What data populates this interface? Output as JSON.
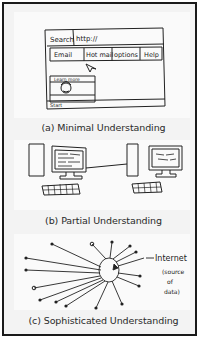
{
  "figure": {
    "panels": [
      {
        "id": "a",
        "caption": "(a) Minimal Understanding",
        "sketch": {
          "type": "browser-window-drawing",
          "address_bar": {
            "label": "Search",
            "value": "http://"
          },
          "menu_items": [
            "Email",
            "Hot mail",
            "options",
            "Help"
          ],
          "embedded_box_title": "Learn more",
          "footer_label": "Start"
        }
      },
      {
        "id": "b",
        "caption": "(b) Partial Understanding",
        "sketch": {
          "type": "two-computers-connected-drawing",
          "computers": 2
        }
      },
      {
        "id": "c",
        "caption": "(c) Sophisticated Understanding",
        "sketch": {
          "type": "hub-and-spoke-drawing",
          "hub_label": "Internet",
          "hub_annotation": "(source of data)",
          "spokes": 16
        }
      }
    ],
    "colors": {
      "border": "#1a1a1a",
      "frame_background": "#f3f3f3",
      "panel_background": "#fafafa",
      "ink": "#222222"
    }
  }
}
